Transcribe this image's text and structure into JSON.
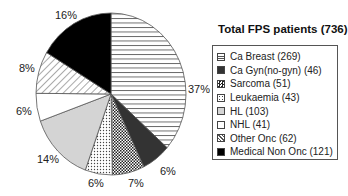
{
  "chart_data": {
    "type": "pie",
    "title": "Total FPS patients (736)",
    "total": 736,
    "categories": [
      "Ca Breast",
      "Ca Gyn(no-gyn)",
      "Sarcoma",
      "Leukaemia",
      "HL",
      "NHL",
      "Other Onc",
      "Medical Non Onc"
    ],
    "values": [
      269,
      46,
      51,
      43,
      103,
      41,
      62,
      121
    ],
    "percent_labels": [
      "37%",
      "6%",
      "7%",
      "6%",
      "14%",
      "6%",
      "8%",
      "16%"
    ],
    "legend_labels": [
      "Ca Breast (269)",
      "Ca Gyn(no-gyn) (46)",
      "Sarcoma (51)",
      "Leukaemia (43)",
      "HL (103)",
      "NHL (41)",
      "Other Onc (62)",
      "Medical Non Onc (121)"
    ],
    "fills": [
      "hlines",
      "darkgray",
      "checker",
      "dots",
      "lightgray",
      "white",
      "diag",
      "black"
    ],
    "legend_position": "right",
    "start_angle": "12 o'clock, clockwise"
  },
  "legend": {
    "title": "Total FPS patients (736)"
  },
  "labels": [
    {
      "text": "37%",
      "x": 188,
      "y": 83
    },
    {
      "text": "6%",
      "x": 160,
      "y": 165
    },
    {
      "text": "7%",
      "x": 128,
      "y": 177
    },
    {
      "text": "6%",
      "x": 88,
      "y": 177
    },
    {
      "text": "14%",
      "x": 37,
      "y": 153
    },
    {
      "text": "6%",
      "x": 16,
      "y": 105
    },
    {
      "text": "8%",
      "x": 19,
      "y": 62
    },
    {
      "text": "16%",
      "x": 55,
      "y": 9
    }
  ]
}
